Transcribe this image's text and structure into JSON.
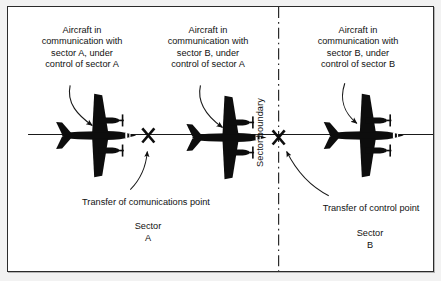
{
  "figure": {
    "colors": {
      "ink": "#111111",
      "frame": "#2b2b2b",
      "mat": "#f2f2f2",
      "paper": "#ffffff"
    }
  },
  "captions": [
    {
      "id": "aircraft-1",
      "text": "Aircraft in\ncommunication with\nsector A, under\ncontrol of sector A"
    },
    {
      "id": "aircraft-2",
      "text": "Aircraft in\ncommunication with\nsector B, under\ncontrol of sector A"
    },
    {
      "id": "aircraft-3",
      "text": "Aircraft in\ncommunication with\nsector B, under\ncontrol of sector B"
    }
  ],
  "markers": [
    {
      "id": "transfer-of-communications-point",
      "glyph": "X",
      "label": "Transfer of comunications point"
    },
    {
      "id": "transfer-of-control-point",
      "glyph": "X",
      "label": "Transfer of control point"
    }
  ],
  "sectors": [
    {
      "id": "sector-a",
      "text": "Sector\nA"
    },
    {
      "id": "sector-b",
      "text": "Sector\nB"
    }
  ],
  "boundary": {
    "label": "Sector boundary",
    "style": "dash-dot"
  },
  "route": {
    "label": "route-track-line"
  },
  "aircraft": [
    {
      "id": "aircraft-1",
      "heading": "east"
    },
    {
      "id": "aircraft-2",
      "heading": "east"
    },
    {
      "id": "aircraft-3",
      "heading": "east"
    }
  ]
}
